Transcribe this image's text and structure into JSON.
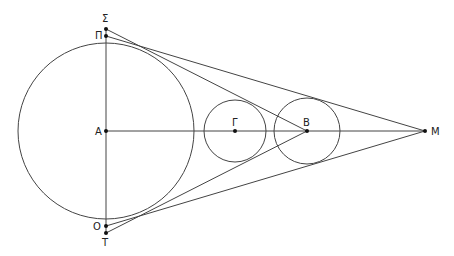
{
  "diagram": {
    "type": "geometry",
    "colors": {
      "stroke": "#444444",
      "point": "#111111",
      "label": "#222222"
    },
    "circles": [
      {
        "name": "circle-A",
        "cx": 106,
        "cy": 131,
        "r": 88
      },
      {
        "name": "circle-Gamma",
        "cx": 235,
        "cy": 131,
        "r": 31
      },
      {
        "name": "circle-B",
        "cx": 307,
        "cy": 131,
        "r": 33
      }
    ],
    "points": {
      "Sigma": {
        "label": "Σ",
        "x": 106,
        "y": 29,
        "lx": 102,
        "ly": 22
      },
      "Pi": {
        "label": "Π",
        "x": 106,
        "y": 36,
        "lx": 95,
        "ly": 39
      },
      "A": {
        "label": "A",
        "x": 106,
        "y": 131,
        "lx": 95,
        "ly": 135
      },
      "Gamma": {
        "label": "Γ",
        "x": 235,
        "y": 131,
        "lx": 232,
        "ly": 126
      },
      "B": {
        "label": "B",
        "x": 307,
        "y": 131,
        "lx": 303,
        "ly": 126
      },
      "M": {
        "label": "M",
        "x": 425,
        "y": 131,
        "lx": 431,
        "ly": 135
      },
      "O": {
        "label": "O",
        "x": 106,
        "y": 226,
        "lx": 93,
        "ly": 230
      },
      "T": {
        "label": "T",
        "x": 106,
        "y": 233,
        "lx": 102,
        "ly": 246
      }
    },
    "segments": [
      {
        "name": "segment-Sigma-T",
        "from": "Sigma",
        "to": "T"
      },
      {
        "name": "segment-A-M",
        "from": "A",
        "to": "M"
      },
      {
        "name": "segment-Sigma-B",
        "from": "Sigma",
        "to": "B"
      },
      {
        "name": "segment-Pi-M",
        "from": "Pi",
        "to": "M"
      },
      {
        "name": "segment-T-B",
        "from": "T",
        "to": "B"
      },
      {
        "name": "segment-O-M",
        "from": "O",
        "to": "M"
      }
    ]
  }
}
